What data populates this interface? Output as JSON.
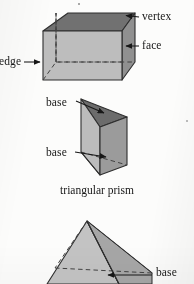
{
  "figure": {
    "kind": "geometry-solids-diagram",
    "background_color": "#fdfdfc",
    "ink_color": "#141414",
    "width": 194,
    "height": 284
  },
  "palette": {
    "face_top_dark": "#6e6e6e",
    "face_right_medium": "#8f8f8f",
    "face_front_light": "#b9b9b9",
    "face_front_lighter": "#c6c6c6",
    "outline": "#2b2b2b",
    "hidden_edge": "#4a4a4a",
    "arrow": "#141414"
  },
  "shapes": [
    {
      "id": "rectangular-prism",
      "name": "rectangular prism",
      "labels": [
        "vertex",
        "face",
        "edge"
      ]
    },
    {
      "id": "triangular-prism",
      "name": "triangular prism",
      "caption": "triangular prism",
      "labels": [
        "base",
        "base"
      ]
    },
    {
      "id": "pyramid",
      "name": "pyramid",
      "labels": [
        "base"
      ]
    }
  ],
  "labels": {
    "vertex": "vertex",
    "face": "face",
    "edge": "edge",
    "base_top": "base",
    "base_bottom": "base",
    "base_pyramid": "base"
  },
  "captions": {
    "triangular_prism": "triangular prism"
  }
}
